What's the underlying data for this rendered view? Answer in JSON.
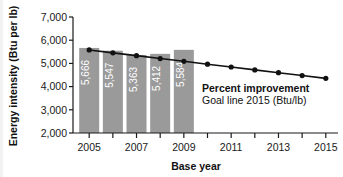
{
  "chart_data": {
    "type": "bar",
    "title": "",
    "xlabel": "Base year",
    "ylabel": "Energy intensity (Btu per lb)",
    "categories": [
      2005,
      2006,
      2007,
      2008,
      2009,
      2010,
      2011,
      2012,
      2013,
      2014,
      2015
    ],
    "xlim": [
      2004.4,
      2015.6
    ],
    "ylim": [
      2000,
      7000
    ],
    "yticks": [
      2000,
      3000,
      4000,
      5000,
      6000,
      7000
    ],
    "ytick_labels": [
      "2,000",
      "3,000",
      "4,000",
      "5,000",
      "6,000",
      "7,000"
    ],
    "xticks": [
      2005,
      2006,
      2007,
      2008,
      2009,
      2010,
      2011,
      2012,
      2013,
      2014,
      2015
    ],
    "xtick_labels": [
      "2005",
      "",
      "2007",
      "",
      "2009",
      "",
      "2011",
      "",
      "2013",
      "",
      "2015"
    ],
    "grid": false,
    "legend_position": "inside-annotation",
    "series": [
      {
        "name": "Energy intensity",
        "type": "bar",
        "color": "#9a9a9a",
        "label_color": "#ffffff",
        "x": [
          2005,
          2006,
          2007,
          2008,
          2009
        ],
        "values": [
          5666,
          5547,
          5363,
          5412,
          5584
        ],
        "data_labels": [
          "5,666",
          "5,547",
          "5,363",
          "5,412",
          "5,584"
        ]
      },
      {
        "name": "Percent improvement Goal line 2015 (Btu/lb)",
        "type": "line",
        "color": "#111111",
        "marker": "circle",
        "x": [
          2005,
          2006,
          2007,
          2008,
          2009,
          2010,
          2011,
          2012,
          2013,
          2014,
          2015
        ],
        "values": [
          5580,
          5455,
          5335,
          5210,
          5090,
          4965,
          4845,
          4720,
          4600,
          4475,
          4355
        ]
      }
    ],
    "annotations": [
      {
        "text": "Percent improvement",
        "style": "bold",
        "x": 2010.2,
        "y": 3950
      },
      {
        "text": "Goal line 2015 (Btu/lb)",
        "style": "regular",
        "x": 2010.2,
        "y": 3560
      }
    ]
  }
}
